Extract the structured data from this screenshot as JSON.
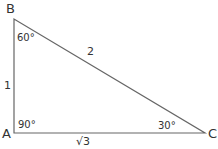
{
  "diagram": {
    "type": "right triangle",
    "vertices": {
      "A": {
        "label": "A",
        "angle": "90°"
      },
      "B": {
        "label": "B",
        "angle": "60°"
      },
      "C": {
        "label": "C",
        "angle": "30°"
      }
    },
    "sides": {
      "AB": "1",
      "BC": "2",
      "AC": "√3"
    },
    "colors": {
      "stroke": "#555555",
      "text": "#333333",
      "background": "#ffffff"
    }
  }
}
